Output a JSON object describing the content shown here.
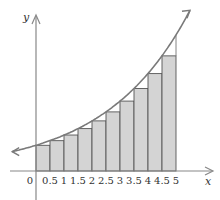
{
  "chart_data": {
    "type": "bar",
    "title": "",
    "xlabel": "x",
    "ylabel": "y",
    "x_tick_labels": [
      "0",
      "0.5",
      "1",
      "1.5",
      "2",
      "2.5",
      "3",
      "3.5",
      "4",
      "4.5",
      "5"
    ],
    "xlim": [
      0,
      5
    ],
    "bar_width": 0.5,
    "categories": [
      "0",
      "0.5",
      "1",
      "1.5",
      "2",
      "2.5",
      "3",
      "3.5",
      "4",
      "4.5"
    ],
    "values": [
      1.0,
      1.18,
      1.4,
      1.65,
      1.95,
      2.3,
      2.72,
      3.21,
      3.79,
      4.48
    ],
    "curve": {
      "x": [
        0,
        0.5,
        1,
        1.5,
        2,
        2.5,
        3,
        3.5,
        4,
        4.5,
        5
      ],
      "y": [
        1.0,
        1.18,
        1.4,
        1.65,
        1.95,
        2.3,
        2.72,
        3.21,
        3.79,
        4.48,
        5.29
      ]
    },
    "grid": false,
    "legend": null,
    "colors": {
      "bar_fill": "#d4d4d4",
      "bar_stroke": "#555555",
      "curve": "#777777",
      "axis": "#888888"
    }
  }
}
